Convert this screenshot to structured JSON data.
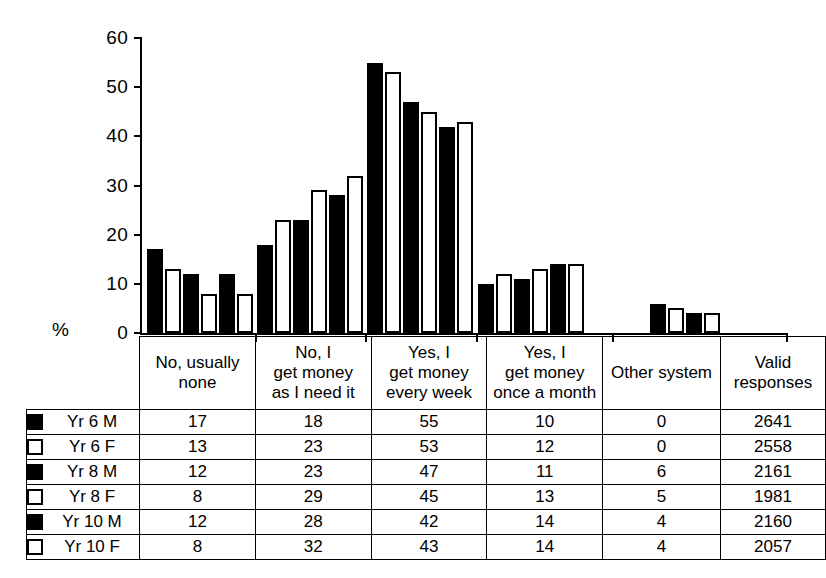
{
  "chart_data": {
    "type": "bar",
    "title": "",
    "xlabel": "",
    "ylabel": "%",
    "ylim": [
      0,
      60
    ],
    "yticks": [
      0,
      10,
      20,
      30,
      40,
      50,
      60
    ],
    "grid": false,
    "legend_position": "table-left-column",
    "categories": [
      "No, usually none",
      "No, I get money as I need it",
      "Yes, I get money every week",
      "Yes, I get money once a month",
      "Other system"
    ],
    "series": [
      {
        "name": "Yr 6 M",
        "fill": "black",
        "values": [
          17,
          18,
          55,
          10,
          0
        ]
      },
      {
        "name": "Yr 6 F",
        "fill": "white",
        "values": [
          13,
          23,
          53,
          12,
          0
        ]
      },
      {
        "name": "Yr 8 M",
        "fill": "black",
        "values": [
          12,
          23,
          47,
          11,
          6
        ]
      },
      {
        "name": "Yr 8 F",
        "fill": "white",
        "values": [
          8,
          29,
          45,
          13,
          5
        ]
      },
      {
        "name": "Yr 10 M",
        "fill": "black",
        "values": [
          12,
          28,
          42,
          14,
          4
        ]
      },
      {
        "name": "Yr 10 F",
        "fill": "white",
        "values": [
          8,
          32,
          43,
          14,
          4
        ]
      }
    ]
  },
  "axis": {
    "percent_label": "%",
    "tick_labels": [
      "60",
      "50",
      "40",
      "30",
      "20",
      "10",
      "0"
    ]
  },
  "table": {
    "headers": [
      "",
      "No, usually none",
      "No, I get money as I need it",
      "Yes, I get money every week",
      "Yes, I get money once a month",
      "Other system",
      "Valid responses"
    ],
    "header_lines": [
      [
        ""
      ],
      [
        "No, usually",
        "none"
      ],
      [
        "No, I",
        "get money",
        "as I need it"
      ],
      [
        "Yes, I",
        "get money",
        "every week"
      ],
      [
        "Yes, I",
        "get money",
        "once a month"
      ],
      [
        "Other system"
      ],
      [
        "Valid",
        "responses"
      ]
    ],
    "rows": [
      {
        "label": "Yr 6 M",
        "swatch": "black",
        "values": [
          "17",
          "18",
          "55",
          "10",
          "0",
          "2641"
        ]
      },
      {
        "label": "Yr 6 F",
        "swatch": "white",
        "values": [
          "13",
          "23",
          "53",
          "12",
          "0",
          "2558"
        ]
      },
      {
        "label": "Yr 8 M",
        "swatch": "black",
        "values": [
          "12",
          "23",
          "47",
          "11",
          "6",
          "2161"
        ]
      },
      {
        "label": "Yr 8 F",
        "swatch": "white",
        "values": [
          "8",
          "29",
          "45",
          "13",
          "5",
          "1981"
        ]
      },
      {
        "label": "Yr 10 M",
        "swatch": "black",
        "values": [
          "12",
          "28",
          "42",
          "14",
          "4",
          "2160"
        ]
      },
      {
        "label": "Yr 10 F",
        "swatch": "white",
        "values": [
          "8",
          "32",
          "43",
          "14",
          "4",
          "2057"
        ]
      }
    ]
  },
  "colors": {
    "male_fill": "#000000",
    "female_fill": "#ffffff",
    "stroke": "#000000",
    "background": "#ffffff"
  }
}
